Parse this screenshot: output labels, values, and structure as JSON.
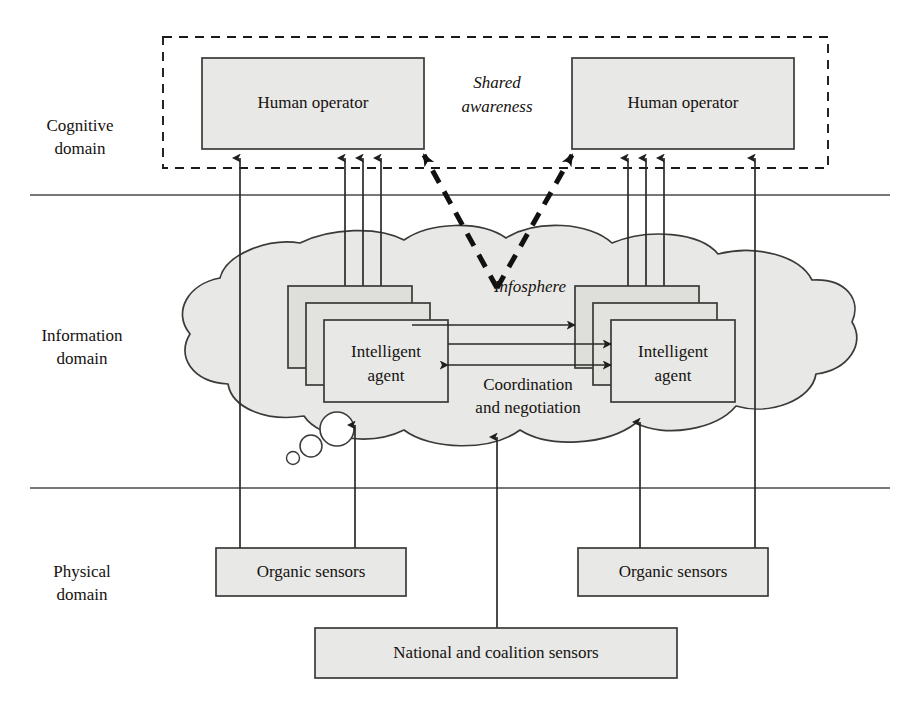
{
  "diagram": {
    "colors": {
      "box_fill": "#e8e8e6",
      "box_stroke": "#3a3a38",
      "cloud_fill": "#e8e8e6",
      "cloud_stroke": "#3a3a38",
      "line": "#2b2b29",
      "dashed": "#1a1a1a",
      "background": "#ffffff",
      "text": "#15120f"
    },
    "domains": [
      {
        "id": "cognitive",
        "line1": "Cognitive",
        "line2": "domain"
      },
      {
        "id": "information",
        "line1": "Information",
        "line2": "domain"
      },
      {
        "id": "physical",
        "line1": "Physical",
        "line2": "domain"
      }
    ],
    "shared_awareness": {
      "line1": "Shared",
      "line2": "awareness"
    },
    "infosphere_label": "Infosphere",
    "coordination": {
      "line1": "Coordination",
      "line2": "and negotiation"
    },
    "operators": [
      {
        "id": "operator-left",
        "line1": "Human",
        "line2": "operator",
        "text": "Human operator"
      },
      {
        "id": "operator-right",
        "line1": "Human",
        "line2": "operator",
        "text": "Human operator"
      }
    ],
    "agents": [
      {
        "id": "agent-left",
        "line1": "Intelligent",
        "line2": "agent"
      },
      {
        "id": "agent-right",
        "line1": "Intelligent",
        "line2": "agent"
      }
    ],
    "sensors": [
      {
        "id": "organic-sensors-left",
        "label": "Organic sensors"
      },
      {
        "id": "organic-sensors-right",
        "label": "Organic sensors"
      },
      {
        "id": "national-coalition-sensors",
        "label": "National and coalition sensors"
      }
    ]
  }
}
